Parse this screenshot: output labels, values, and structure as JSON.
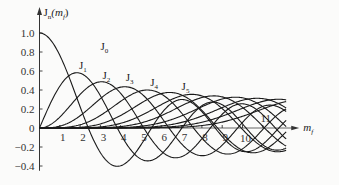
{
  "chart_data": {
    "type": "line",
    "title": "",
    "xlabel": "m_f",
    "ylabel": "J_n(m_f)",
    "xlim": [
      0,
      12.5
    ],
    "ylim": [
      -0.45,
      1.05
    ],
    "grid": false,
    "legend": "inline curve labels",
    "x_ticks": [
      "1",
      "2",
      "3",
      "4",
      "5",
      "6",
      "7",
      "8",
      "9",
      "10",
      "11"
    ],
    "y_ticks": [
      "1.0",
      "0.8",
      "0.6",
      "0.4",
      "0.2",
      "0",
      "-0.2",
      "-0.4"
    ],
    "series": [
      {
        "name": "J0",
        "order": 0,
        "label_pos": [
          3.0,
          0.82
        ]
      },
      {
        "name": "J1",
        "order": 1,
        "label_pos": [
          1.95,
          0.62
        ]
      },
      {
        "name": "J2",
        "order": 2,
        "label_pos": [
          3.1,
          0.52
        ]
      },
      {
        "name": "J3",
        "order": 3,
        "label_pos": [
          4.25,
          0.5
        ]
      },
      {
        "name": "J4",
        "order": 4,
        "label_pos": [
          5.45,
          0.44
        ]
      },
      {
        "name": "J5",
        "order": 5,
        "label_pos": [
          7.0,
          0.4
        ]
      }
    ],
    "extra_unlabeled_orders": [
      6,
      7,
      8,
      9,
      10,
      11
    ],
    "x_label_offsets": {
      "10": [
        0,
        1
      ],
      "11": [
        0,
        -1
      ]
    }
  },
  "axes": {
    "y_title": "J",
    "y_title_sub": "n",
    "y_title_arg": "(m",
    "y_title_arg_sub": "f",
    "y_title_close": ")",
    "x_title": "m",
    "x_title_sub": "f"
  }
}
